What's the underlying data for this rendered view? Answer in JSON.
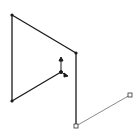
{
  "viewport": {
    "width": 137,
    "height": 139,
    "background": "#ffffff"
  },
  "colors": {
    "sketch_line": "#1a1a1a",
    "construction_line": "#8a8a8a",
    "vertex": "#1a1a1a"
  },
  "sketch": {
    "vertices": [
      {
        "id": "v1",
        "x": 12,
        "y": 15
      },
      {
        "id": "v2",
        "x": 76,
        "y": 53
      },
      {
        "id": "v3",
        "x": 12,
        "y": 101
      },
      {
        "id": "v4",
        "x": 61,
        "y": 72
      },
      {
        "id": "v5",
        "x": 76,
        "y": 126
      },
      {
        "id": "v6",
        "x": 130,
        "y": 95
      }
    ],
    "origin_icon": "coordinate-origin-icon"
  }
}
